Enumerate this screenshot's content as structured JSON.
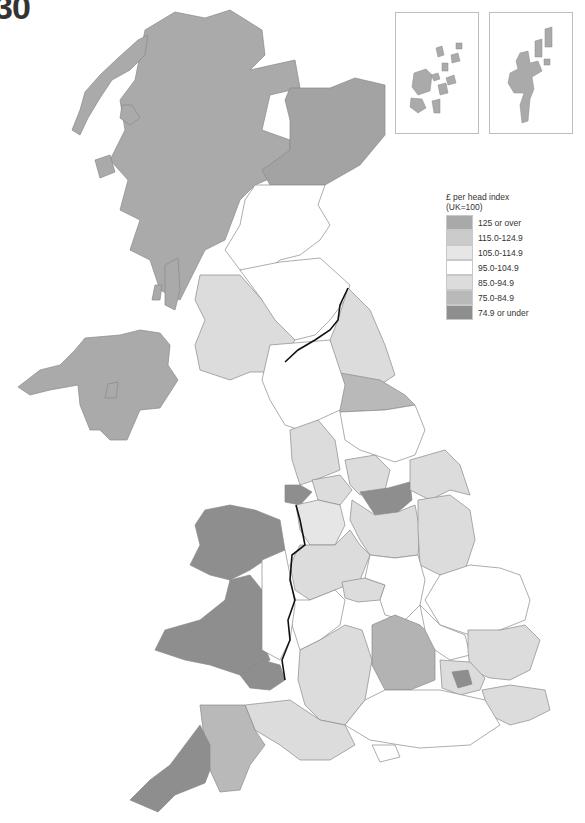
{
  "figure": {
    "number_fragment": "30"
  },
  "legend": {
    "title_line1": "£ per head index",
    "title_line2": "(UK=100)",
    "items": [
      {
        "label": "125 or over",
        "color": "#a9a9a9"
      },
      {
        "label": "115.0-124.9",
        "color": "#cbcbcb"
      },
      {
        "label": "105.0-114.9",
        "color": "#e6e6e6"
      },
      {
        "label": "95.0-104.9",
        "color": "#ffffff"
      },
      {
        "label": "85.0-94.9",
        "color": "#dcdcdc"
      },
      {
        "label": "75.0-84.9",
        "color": "#b9b9b9"
      },
      {
        "label": "74.9 or under",
        "color": "#8e8e8e"
      }
    ]
  },
  "colors": {
    "c125": "#a9a9a9",
    "c115": "#cbcbcb",
    "c105": "#e6e6e6",
    "c95": "#ffffff",
    "c85": "#dcdcdc",
    "c75": "#b9b9b9",
    "c74": "#8e8e8e",
    "border": "#8a8a8a",
    "national_border": "#111111"
  },
  "insets": [
    {
      "name": "Orkney",
      "band": "125 or over"
    },
    {
      "name": "Shetland",
      "band": "125 or over"
    }
  ]
}
